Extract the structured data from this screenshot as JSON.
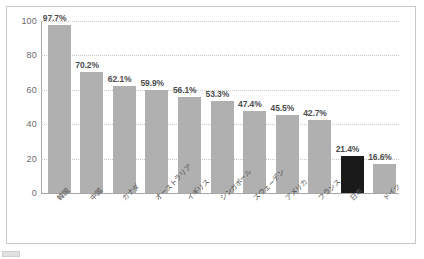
{
  "chart_data": {
    "type": "bar",
    "title": "",
    "xlabel": "",
    "ylabel": "",
    "ylim": [
      0,
      100
    ],
    "yticks": [
      "0",
      "20",
      "40",
      "60",
      "80",
      "100"
    ],
    "grid": true,
    "legend": "none",
    "categories": [
      "韓国",
      "中国",
      "カナダ",
      "オーストラリア",
      "イギリス",
      "シンガポール",
      "スウェーデン",
      "アメリカ",
      "フランス",
      "日本",
      "ドイツ"
    ],
    "values": [
      97.7,
      70.2,
      62.1,
      59.9,
      56.1,
      53.3,
      47.4,
      45.5,
      42.7,
      21.4,
      16.6
    ],
    "value_labels": [
      "97.7%",
      "70.2%",
      "62.1%",
      "59.9%",
      "56.1%",
      "53.3%",
      "47.4%",
      "45.5%",
      "42.7%",
      "21.4%",
      "16.6%"
    ],
    "bar_colors": [
      "#b0b0b0",
      "#b0b0b0",
      "#b0b0b0",
      "#b0b0b0",
      "#b0b0b0",
      "#b0b0b0",
      "#b0b0b0",
      "#b0b0b0",
      "#b0b0b0",
      "#1a1a1a",
      "#b0b0b0"
    ],
    "highlight_index": 9
  },
  "caption": {
    "text": ""
  },
  "colors": {
    "bar": "#b0b0b0",
    "bar_highlight": "#1a1a1a",
    "axis": "#a6a6a6",
    "grid": "#c9c9c9",
    "frame": "#c8c8c8",
    "text": "#4d4d4d"
  }
}
